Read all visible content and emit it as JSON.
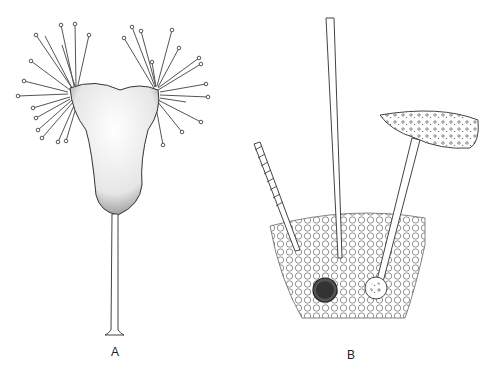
{
  "figure": {
    "panels": [
      {
        "id": "A",
        "label": "A",
        "description": "Stalked organism with two tentacle clusters (capitate tentacles) on a cup-shaped body"
      },
      {
        "id": "B",
        "label": "B",
        "description": "Section of cell tissue showing three extruded structures: a coiled thread, a straight rod, and a tube attached to prey"
      }
    ]
  }
}
